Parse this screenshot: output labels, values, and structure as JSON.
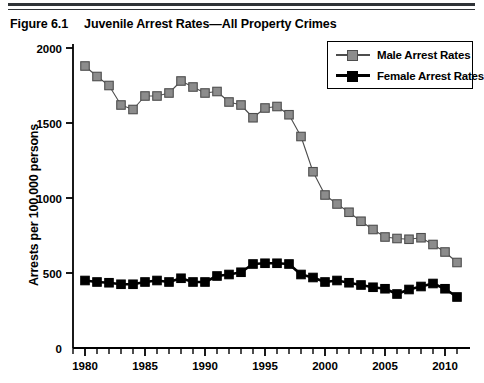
{
  "figure": {
    "label": "Figure 6.1",
    "title": "Juvenile Arrest Rates—All Property Crimes"
  },
  "colors": {
    "male": "#8c8c8c",
    "male_edge": "#4d4d4d",
    "female": "#000000",
    "axis": "#000000",
    "rule": "#2f3337",
    "background": "#ffffff"
  },
  "legend": {
    "position": "top-right",
    "items": [
      {
        "label": "Male Arrest Rates",
        "marker": "square",
        "color": "#8c8c8c"
      },
      {
        "label": "Female Arrest Rates",
        "marker": "square",
        "color": "#000000"
      }
    ]
  },
  "chart_data": {
    "type": "line",
    "title": "Juvenile Arrest Rates—All Property Crimes",
    "xlabel": "",
    "ylabel": "Arrests per 100,000 persons",
    "xlim": [
      1979,
      2011.5
    ],
    "ylim": [
      0,
      2000
    ],
    "yticks": [
      0,
      500,
      1000,
      1500,
      2000
    ],
    "ytick_labels": [
      "0",
      "500",
      "1000",
      "1500",
      "2000"
    ],
    "xticks": [
      1980,
      1985,
      1990,
      1995,
      2000,
      2005,
      2010
    ],
    "xtick_labels": [
      "1980",
      "1985",
      "1990",
      "1995",
      "2000",
      "2005",
      "2010"
    ],
    "xminor_step": 1,
    "grid": false,
    "x": [
      1980,
      1981,
      1982,
      1983,
      1984,
      1985,
      1986,
      1987,
      1988,
      1989,
      1990,
      1991,
      1992,
      1993,
      1994,
      1995,
      1996,
      1997,
      1998,
      1999,
      2000,
      2001,
      2002,
      2003,
      2004,
      2005,
      2006,
      2007,
      2008,
      2009,
      2010,
      2011
    ],
    "series": [
      {
        "name": "Male Arrest Rates",
        "color": "#8c8c8c",
        "values": [
          1880,
          1810,
          1750,
          1620,
          1590,
          1680,
          1680,
          1700,
          1780,
          1740,
          1700,
          1710,
          1640,
          1620,
          1535,
          1600,
          1610,
          1555,
          1410,
          1175,
          1020,
          960,
          905,
          845,
          790,
          740,
          730,
          725,
          735,
          690,
          640,
          570
        ]
      },
      {
        "name": "Female Arrest Rates",
        "color": "#000000",
        "values": [
          450,
          440,
          435,
          425,
          425,
          440,
          450,
          440,
          465,
          440,
          440,
          480,
          490,
          505,
          560,
          565,
          565,
          560,
          490,
          470,
          440,
          450,
          435,
          420,
          405,
          395,
          360,
          390,
          410,
          430,
          395,
          340
        ]
      }
    ]
  }
}
